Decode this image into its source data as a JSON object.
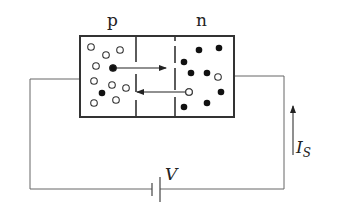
{
  "diagram": {
    "labels": {
      "p_region": "p",
      "n_region": "n",
      "voltage": "V",
      "current_main": "I",
      "current_sub": "S"
    },
    "colors": {
      "stroke": "#333333",
      "wire": "#555555",
      "background": "#ffffff"
    },
    "box": {
      "x": 80,
      "y": 36,
      "width": 154,
      "height": 81
    },
    "depletion_lines": [
      {
        "x": 136,
        "segments": [
          [
            36,
            62
          ],
          [
            74,
            92
          ],
          [
            100,
            117
          ]
        ]
      },
      {
        "x": 175,
        "segments": [
          [
            36,
            41
          ],
          [
            46,
            63
          ],
          [
            68,
            90
          ],
          [
            97,
            117
          ]
        ]
      }
    ],
    "p_region": {
      "holes": [
        [
          91,
          47
        ],
        [
          106,
          55
        ],
        [
          120,
          50
        ],
        [
          96,
          66
        ],
        [
          94,
          81
        ],
        [
          112,
          85
        ],
        [
          126,
          88
        ],
        [
          94,
          103
        ],
        [
          116,
          100
        ]
      ],
      "electrons": [
        [
          113,
          68
        ],
        [
          102,
          93
        ]
      ]
    },
    "n_region": {
      "holes": [
        [
          218,
          77
        ],
        [
          189,
          92
        ]
      ],
      "electrons": [
        [
          199,
          50
        ],
        [
          219,
          48
        ],
        [
          184,
          62
        ],
        [
          191,
          73
        ],
        [
          207,
          73
        ],
        [
          221,
          92
        ],
        [
          184,
          107
        ],
        [
          207,
          103
        ]
      ]
    },
    "drift_arrows": [
      {
        "name": "electron-drift-arrow",
        "x1": 113,
        "y1": 68,
        "x2": 166,
        "y2": 68
      },
      {
        "name": "hole-drift-arrow",
        "x1": 189,
        "y1": 92,
        "x2": 137,
        "y2": 92
      }
    ],
    "circuit": {
      "left_wire_y": 79,
      "right_wire_y": 76,
      "left_x": 30,
      "right_x": 284,
      "bottom_y": 189,
      "battery": {
        "short_plate_x": 152,
        "long_plate_x": 160
      }
    },
    "current_arrow": {
      "x": 293,
      "y_start": 155,
      "y_end": 106
    }
  }
}
